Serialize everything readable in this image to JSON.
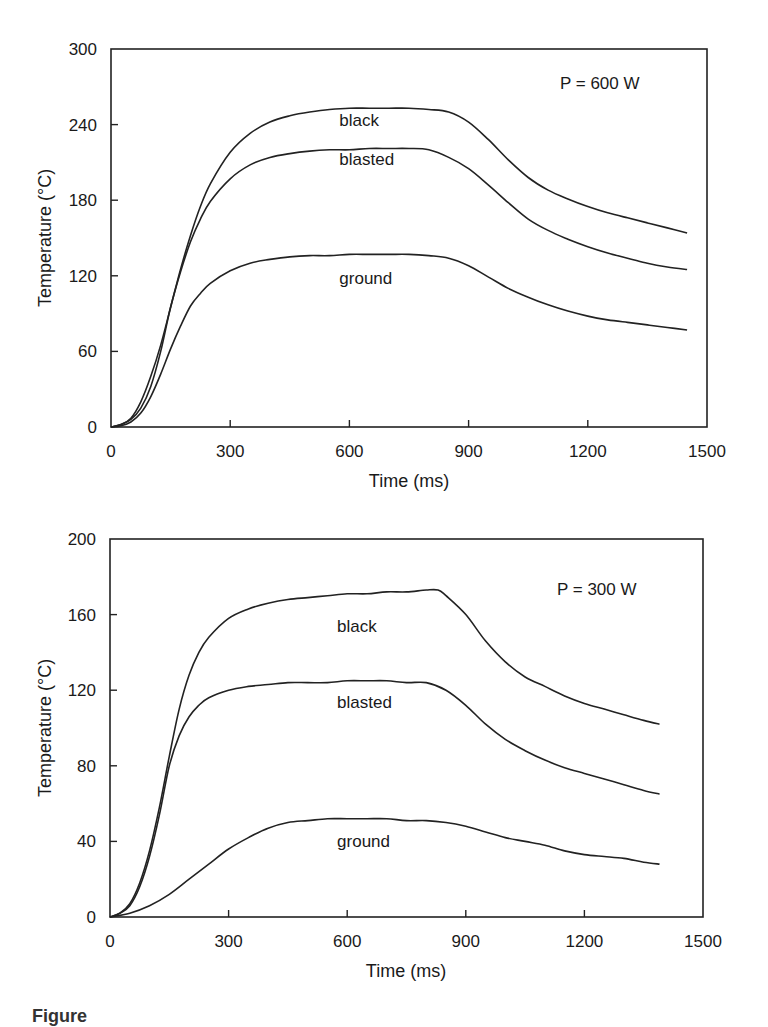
{
  "chart_data": [
    {
      "type": "line",
      "title": "",
      "annotation": "P = 600 W",
      "xlabel": "Time (ms)",
      "ylabel": "Temperature (°C)",
      "xlim": [
        0,
        1500
      ],
      "ylim": [
        0,
        300
      ],
      "xticks": [
        0,
        300,
        600,
        900,
        1200,
        1500
      ],
      "yticks": [
        0,
        60,
        120,
        180,
        240,
        300
      ],
      "grid": false,
      "legend": "inline curve labels",
      "series": [
        {
          "name": "black",
          "label_pos": [
            620,
            244
          ],
          "x": [
            0,
            25,
            50,
            75,
            100,
            125,
            150,
            175,
            200,
            225,
            250,
            300,
            350,
            400,
            450,
            500,
            550,
            600,
            650,
            700,
            750,
            800,
            850,
            900,
            950,
            1000,
            1050,
            1100,
            1150,
            1200,
            1250,
            1300,
            1350,
            1400,
            1450
          ],
          "values": [
            0,
            2,
            7,
            20,
            40,
            65,
            95,
            125,
            152,
            175,
            193,
            218,
            233,
            242,
            247,
            250,
            252,
            253,
            253,
            253,
            253,
            252,
            250,
            242,
            228,
            212,
            198,
            188,
            181,
            175,
            170,
            166,
            162,
            158,
            154
          ]
        },
        {
          "name": "blasted",
          "label_pos": [
            620,
            213
          ],
          "x": [
            0,
            25,
            50,
            75,
            100,
            125,
            150,
            175,
            200,
            225,
            250,
            300,
            350,
            400,
            450,
            500,
            550,
            600,
            650,
            700,
            750,
            800,
            850,
            900,
            950,
            1000,
            1050,
            1100,
            1150,
            1200,
            1250,
            1300,
            1350,
            1400,
            1450
          ],
          "values": [
            0,
            2,
            6,
            15,
            32,
            60,
            95,
            123,
            147,
            165,
            179,
            197,
            208,
            214,
            217,
            219,
            220,
            220,
            221,
            221,
            221,
            220,
            214,
            205,
            192,
            178,
            165,
            156,
            149,
            143,
            138,
            134,
            130,
            127,
            125
          ]
        },
        {
          "name": "ground",
          "label_pos": [
            620,
            118
          ],
          "x": [
            0,
            25,
            50,
            75,
            100,
            125,
            150,
            175,
            200,
            225,
            250,
            300,
            350,
            400,
            450,
            500,
            550,
            600,
            650,
            700,
            750,
            800,
            850,
            900,
            950,
            1000,
            1050,
            1100,
            1150,
            1200,
            1250,
            1300,
            1350,
            1400,
            1450
          ],
          "values": [
            0,
            1,
            4,
            11,
            24,
            42,
            62,
            80,
            96,
            106,
            114,
            124,
            130,
            133,
            135,
            136,
            136,
            137,
            137,
            137,
            137,
            136,
            134,
            128,
            119,
            110,
            103,
            97,
            92,
            88,
            85,
            83,
            81,
            79,
            77
          ]
        }
      ]
    },
    {
      "type": "line",
      "title": "",
      "annotation": "P = 300 W",
      "xlabel": "Time (ms)",
      "ylabel": "Temperature (°C)",
      "xlim": [
        0,
        1500
      ],
      "ylim": [
        0,
        200
      ],
      "xticks": [
        0,
        300,
        600,
        900,
        1200,
        1500
      ],
      "yticks": [
        0,
        40,
        80,
        120,
        160,
        200
      ],
      "grid": false,
      "legend": "inline curve labels",
      "series": [
        {
          "name": "black",
          "label_pos": [
            620,
            154
          ],
          "x": [
            0,
            25,
            50,
            75,
            100,
            125,
            150,
            175,
            200,
            225,
            250,
            300,
            350,
            400,
            450,
            500,
            550,
            600,
            650,
            700,
            750,
            800,
            830,
            850,
            900,
            950,
            1000,
            1050,
            1100,
            1150,
            1200,
            1250,
            1300,
            1350,
            1390
          ],
          "values": [
            0,
            2,
            7,
            18,
            35,
            58,
            85,
            110,
            128,
            140,
            148,
            158,
            163,
            166,
            168,
            169,
            170,
            171,
            171,
            172,
            172,
            173,
            173,
            170,
            160,
            146,
            135,
            127,
            122,
            117,
            113,
            110,
            107,
            104,
            102
          ]
        },
        {
          "name": "blasted",
          "label_pos": [
            620,
            114
          ],
          "x": [
            0,
            25,
            50,
            75,
            100,
            125,
            150,
            175,
            200,
            225,
            250,
            300,
            350,
            400,
            450,
            500,
            550,
            600,
            650,
            700,
            750,
            800,
            850,
            900,
            950,
            1000,
            1050,
            1100,
            1150,
            1200,
            1250,
            1300,
            1350,
            1390
          ],
          "values": [
            0,
            2,
            6,
            16,
            32,
            54,
            80,
            96,
            106,
            112,
            116,
            120,
            122,
            123,
            124,
            124,
            124,
            125,
            125,
            125,
            124,
            124,
            120,
            112,
            102,
            94,
            88,
            83,
            79,
            76,
            73,
            70,
            67,
            65
          ]
        },
        {
          "name": "ground",
          "label_pos": [
            620,
            40
          ],
          "x": [
            0,
            50,
            100,
            150,
            200,
            250,
            300,
            350,
            400,
            450,
            500,
            550,
            600,
            650,
            700,
            750,
            800,
            850,
            900,
            950,
            1000,
            1050,
            1100,
            1150,
            1200,
            1250,
            1300,
            1350,
            1390
          ],
          "values": [
            0,
            2,
            6,
            12,
            20,
            28,
            36,
            42,
            47,
            50,
            51,
            52,
            52,
            52,
            52,
            51,
            51,
            50,
            48,
            45,
            42,
            40,
            38,
            35,
            33,
            32,
            31,
            29,
            28
          ]
        }
      ]
    }
  ],
  "charts": [
    {
      "annotation": "P = 600 W",
      "xlabel": "Time (ms)",
      "ylabel": "Temperature (°C)",
      "xtick_labels": [
        "0",
        "300",
        "600",
        "900",
        "1200",
        "1500"
      ],
      "ytick_labels": [
        "0",
        "60",
        "120",
        "180",
        "240",
        "300"
      ],
      "labels": {
        "black": "black",
        "blasted": "blasted",
        "ground": "ground"
      }
    },
    {
      "annotation": "P = 300 W",
      "xlabel": "Time (ms)",
      "ylabel": "Temperature (°C)",
      "xtick_labels": [
        "0",
        "300",
        "600",
        "900",
        "1200",
        "1500"
      ],
      "ytick_labels": [
        "0",
        "40",
        "80",
        "120",
        "160",
        "200"
      ],
      "labels": {
        "black": "black",
        "blasted": "blasted",
        "ground": "ground"
      }
    }
  ],
  "caption": "Figure"
}
